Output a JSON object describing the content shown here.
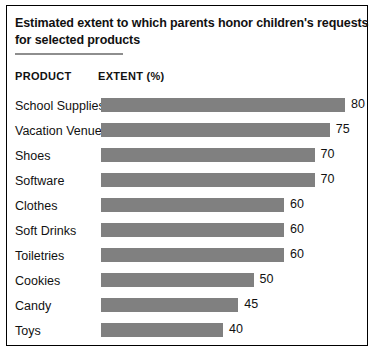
{
  "card": {
    "title_line_1": "Estimated extent to which parents honor children's requests",
    "title_line_2": "for selected products"
  },
  "table": {
    "header_product": "PRODUCT",
    "header_extent": "EXTENT (%)"
  },
  "chart_data": {
    "type": "bar",
    "orientation": "horizontal",
    "title": "Estimated extent to which parents honor children's requests for selected products",
    "xlabel": "EXTENT (%)",
    "ylabel": "PRODUCT",
    "xlim": [
      0,
      88
    ],
    "grid": false,
    "legend": null,
    "bar_color": "#808080",
    "categories": [
      "School Supplies",
      "Vacation Venue",
      "Shoes",
      "Software",
      "Clothes",
      "Soft Drinks",
      "Toiletries",
      "Cookies",
      "Candy",
      "Toys"
    ],
    "values": [
      80,
      75,
      70,
      70,
      60,
      60,
      60,
      50,
      45,
      40
    ],
    "data_labels": [
      "80",
      "75",
      "70",
      "70",
      "60",
      "60",
      "60",
      "50",
      "45",
      "40"
    ]
  }
}
